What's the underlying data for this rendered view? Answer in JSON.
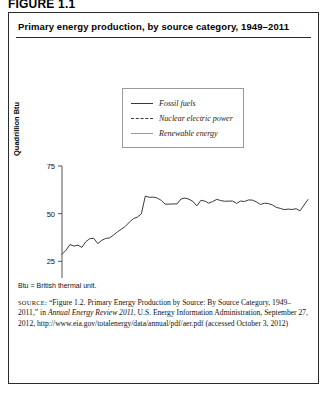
{
  "figure": {
    "label": "FIGURE 1.1",
    "title": "Primary energy production, by source category, 1949–2011"
  },
  "legend": {
    "position": "inside-top-center",
    "items": [
      {
        "label": "Fossil fuels",
        "style": "solid",
        "color": "#3a3a3a"
      },
      {
        "label": "Nuclear electric power",
        "style": "dashed",
        "color": "#3a3a3a"
      },
      {
        "label": "Renewable energy",
        "style": "solid",
        "color": "#9b9b9b"
      }
    ]
  },
  "notes": {
    "abbreviation": "Btu = British thermal unit."
  },
  "source": {
    "prefix": "SOURCE:",
    "part1": " “Figure 1.2. Primary Energy Production by Source: By Source Category, 1949–2011,” in ",
    "italic": "Annual Energy Review 2011",
    "part2": ", U.S. Energy Information Administration, September 27, 2012, http://www.eia.gov/totalenergy/data/annual/pdf/aer.pdf (accessed October 3, 2012)"
  },
  "chart_data": {
    "type": "line",
    "title": "Primary energy production, by source category, 1949–2011",
    "xlabel": "",
    "ylabel": "Quadrillion Btu",
    "xlim": [
      1949,
      2011
    ],
    "ylim": [
      0,
      75
    ],
    "xticks": [
      1950,
      1960,
      1970,
      1980,
      1990,
      2000,
      2010
    ],
    "yticks": [
      0,
      25,
      50,
      75
    ],
    "grid": false,
    "x": [
      1949,
      1950,
      1951,
      1952,
      1953,
      1954,
      1955,
      1956,
      1957,
      1958,
      1959,
      1960,
      1961,
      1962,
      1963,
      1964,
      1965,
      1966,
      1967,
      1968,
      1969,
      1970,
      1971,
      1972,
      1973,
      1974,
      1975,
      1976,
      1977,
      1978,
      1979,
      1980,
      1981,
      1982,
      1983,
      1984,
      1985,
      1986,
      1987,
      1988,
      1989,
      1990,
      1991,
      1992,
      1993,
      1994,
      1995,
      1996,
      1997,
      1998,
      1999,
      2000,
      2001,
      2002,
      2003,
      2004,
      2005,
      2006,
      2007,
      2008,
      2009,
      2010,
      2011
    ],
    "series": [
      {
        "name": "Fossil fuels",
        "style": "solid",
        "color": "#3a3a3a",
        "values": [
          28.7,
          30.8,
          33.8,
          33.0,
          33.5,
          32.3,
          35.3,
          36.9,
          37.1,
          34.3,
          36.0,
          37.0,
          37.3,
          38.8,
          40.5,
          41.9,
          43.4,
          45.6,
          47.4,
          48.2,
          49.9,
          59.2,
          58.6,
          58.7,
          58.2,
          57.0,
          55.0,
          55.0,
          55.1,
          55.1,
          57.7,
          58.2,
          57.6,
          56.4,
          54.1,
          57.0,
          56.6,
          55.5,
          56.4,
          57.5,
          56.9,
          56.5,
          56.6,
          56.6,
          55.4,
          56.6,
          56.4,
          57.2,
          57.1,
          56.2,
          54.8,
          55.5,
          55.3,
          54.6,
          53.3,
          52.8,
          52.1,
          52.4,
          52.2,
          52.6,
          51.5,
          54.5,
          57.4
        ]
      },
      {
        "name": "Nuclear electric power",
        "style": "dashed",
        "color": "#3a3a3a",
        "values": [
          0.0,
          0.0,
          0.0,
          0.0,
          0.0,
          0.0,
          0.0,
          0.0,
          0.0,
          0.0,
          0.0,
          0.0,
          0.0,
          0.0,
          0.0,
          0.0,
          0.0,
          0.1,
          0.1,
          0.1,
          0.2,
          0.2,
          0.4,
          0.6,
          0.9,
          1.3,
          1.9,
          2.1,
          2.7,
          3.0,
          2.8,
          2.7,
          3.0,
          3.1,
          3.2,
          3.6,
          4.1,
          4.5,
          4.9,
          5.6,
          5.7,
          6.1,
          6.4,
          6.5,
          6.5,
          6.8,
          7.1,
          7.1,
          6.7,
          7.1,
          7.6,
          7.9,
          8.0,
          8.1,
          7.9,
          8.2,
          8.2,
          8.2,
          8.5,
          8.5,
          8.4,
          8.4,
          8.3
        ]
      },
      {
        "name": "Renewable energy",
        "style": "solid",
        "color": "#9b9b9b",
        "values": [
          2.9,
          2.9,
          2.9,
          2.9,
          2.8,
          2.7,
          2.8,
          2.9,
          2.8,
          2.9,
          2.9,
          2.9,
          3.0,
          3.1,
          3.1,
          3.2,
          3.4,
          3.4,
          3.5,
          3.5,
          3.6,
          4.1,
          4.2,
          4.3,
          4.4,
          4.8,
          4.7,
          4.7,
          4.2,
          5.0,
          5.1,
          5.5,
          5.5,
          5.8,
          6.4,
          6.5,
          6.2,
          6.3,
          5.7,
          5.6,
          6.3,
          6.2,
          6.2,
          6.1,
          6.3,
          6.3,
          6.7,
          7.2,
          7.2,
          6.7,
          6.7,
          6.3,
          5.4,
          5.9,
          6.2,
          6.3,
          6.4,
          6.9,
          6.8,
          7.3,
          7.7,
          8.2,
          9.2
        ]
      }
    ]
  }
}
